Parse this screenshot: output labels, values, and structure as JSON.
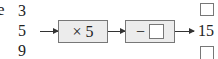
{
  "diagram": {
    "type": "function-machine",
    "leading_text_fragment": "e",
    "inputs": [
      "3",
      "5",
      "9"
    ],
    "operations": [
      {
        "label": "× 5"
      },
      {
        "label": "−",
        "operand_blank": true
      }
    ],
    "outputs": [
      {
        "value": null,
        "blank": true
      },
      {
        "value": "15",
        "blank": false
      },
      {
        "value": null,
        "blank": true
      }
    ],
    "colors": {
      "machine_fill": "#ececec",
      "border": "#777777",
      "arrow": "#333333"
    }
  }
}
